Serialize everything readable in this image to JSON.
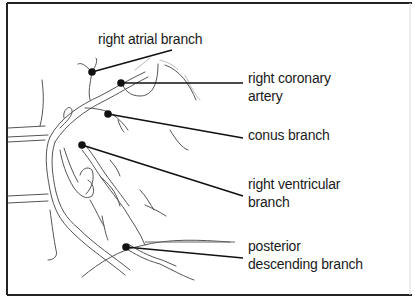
{
  "diagram": {
    "colors": {
      "frame": "#222222",
      "leader": "#111111",
      "vessel": "#555555",
      "text": "#1a1a1a"
    },
    "labels": [
      {
        "id": "right-atrial-branch",
        "lines": [
          "right atrial branch"
        ],
        "x": 98,
        "y": 30
      },
      {
        "id": "right-coronary-artery",
        "lines": [
          "right coronary",
          "artery"
        ],
        "x": 248,
        "y": 69
      },
      {
        "id": "conus-branch",
        "lines": [
          "conus branch"
        ],
        "x": 248,
        "y": 126
      },
      {
        "id": "right-ventricular-branch",
        "lines": [
          "right ventricular",
          "branch"
        ],
        "x": 248,
        "y": 175
      },
      {
        "id": "posterior-descending-branch",
        "lines": [
          "posterior",
          "descending branch"
        ],
        "x": 248,
        "y": 237
      }
    ]
  }
}
